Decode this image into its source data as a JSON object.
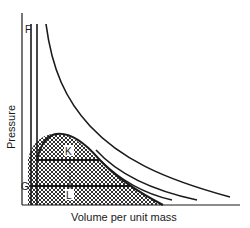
{
  "diagram": {
    "type": "pressure-volume phase diagram",
    "axes": {
      "x_label": "Volume per unit mass",
      "y_label": "Pressure"
    },
    "point_labels": {
      "F": "F",
      "G": "G",
      "K": "K",
      "L": "L"
    },
    "regions": [
      {
        "name": "two-phase-dome",
        "fill": "crosshatch"
      }
    ],
    "curves": [
      {
        "name": "isotherm-high",
        "description": "outermost hyperbolic curve"
      },
      {
        "name": "isotherm-mid",
        "description": "middle curve"
      },
      {
        "name": "isotherm-low",
        "description": "inner curve bordering dome"
      }
    ],
    "horizontal_lines": [
      {
        "name": "tie-line-K",
        "label": "K"
      },
      {
        "name": "tie-line-G",
        "label": "G"
      }
    ],
    "colors": {
      "ink": "#1a1a1a",
      "background": "#ffffff"
    }
  }
}
